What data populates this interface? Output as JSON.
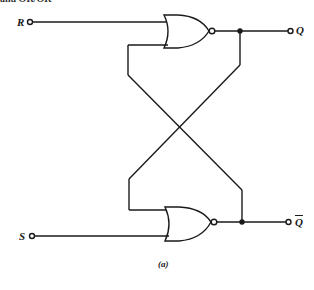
{
  "diagram": {
    "title_fragment": "and OR/OR",
    "type": "SR latch using cross-coupled NOR gates",
    "inputs": [
      {
        "label": "R",
        "gate": "top-nor"
      },
      {
        "label": "S",
        "gate": "bottom-nor"
      }
    ],
    "outputs": [
      {
        "label": "Q",
        "gate": "top-nor"
      },
      {
        "label": "Q",
        "overbar": true,
        "gate": "bottom-nor"
      }
    ],
    "gates": [
      {
        "id": "top-nor",
        "kind": "NOR"
      },
      {
        "id": "bottom-nor",
        "kind": "NOR"
      }
    ],
    "caption": "(a)",
    "stroke_color": "#1a1a1a"
  }
}
